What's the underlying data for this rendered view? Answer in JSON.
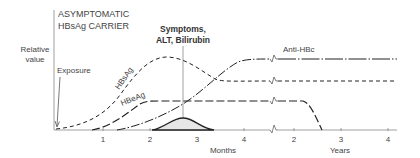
{
  "chart_data": {
    "type": "line",
    "title": "ASYMPTOMATIC HBsAg CARRIER",
    "title_lines": [
      "ASYMPTOMATIC",
      "HBsAg CARRIER"
    ],
    "ylabel_lines": [
      "Relative",
      "value"
    ],
    "xlabel_months": "Months",
    "xlabel_years": "Years",
    "x_ticks_months": [
      "1",
      "2",
      "3",
      "4"
    ],
    "x_ticks_years": [
      "2",
      "3",
      "4"
    ],
    "axis_break": true,
    "annotations": {
      "exposure": "Exposure",
      "symptoms_lines": [
        "Symptoms,",
        "ALT, Bilirubin"
      ],
      "symptoms_at_month": 2.7
    },
    "series": [
      {
        "name": "HBsAg",
        "style": "dashed",
        "description": "rises from exposure, peaks ~2.3 months, declines to persistent plateau",
        "points": [
          [
            0,
            0.02
          ],
          [
            1,
            0.2
          ],
          [
            1.5,
            0.5
          ],
          [
            2,
            0.72
          ],
          [
            2.3,
            0.76
          ],
          [
            2.7,
            0.7
          ],
          [
            3.3,
            0.52
          ],
          [
            3.6,
            0.5
          ],
          [
            4,
            0.5
          ],
          [
            "2y",
            0.5
          ],
          [
            "3y",
            0.5
          ],
          [
            "4y",
            0.5
          ]
        ]
      },
      {
        "name": "HBeAg",
        "style": "long-dash",
        "description": "rises after ~1 month, plateaus, disappears ~2.7 years",
        "points": [
          [
            0.7,
            0
          ],
          [
            1.3,
            0.12
          ],
          [
            1.8,
            0.3
          ],
          [
            2,
            0.33
          ],
          [
            3,
            0.33
          ],
          [
            4,
            0.33
          ],
          [
            "2y",
            0.33
          ],
          [
            "2.2y",
            0.33
          ],
          [
            "2.6y",
            0.0
          ]
        ]
      },
      {
        "name": "Anti-HBc",
        "style": "dash-dot",
        "description": "rises from ~1.3 months to high persistent plateau",
        "points": [
          [
            1.3,
            0
          ],
          [
            2,
            0.1
          ],
          [
            2.7,
            0.3
          ],
          [
            3.5,
            0.6
          ],
          [
            4,
            0.7
          ],
          [
            "2y",
            0.7
          ],
          [
            "3y",
            0.7
          ],
          [
            "4y",
            0.7
          ]
        ]
      },
      {
        "name": "Symptoms, ALT, Bilirubin",
        "style": "filled-hump",
        "description": "transient hump centered ~2.7 months",
        "points": [
          [
            2,
            0
          ],
          [
            2.4,
            0.06
          ],
          [
            2.7,
            0.1
          ],
          [
            3,
            0.06
          ],
          [
            3.3,
            0
          ]
        ]
      }
    ],
    "series_labels": {
      "hbsag": "HBsAg",
      "hbeag": "HBeAg",
      "antihbc": "Anti-HBc"
    },
    "grid": false,
    "legend": "none"
  }
}
